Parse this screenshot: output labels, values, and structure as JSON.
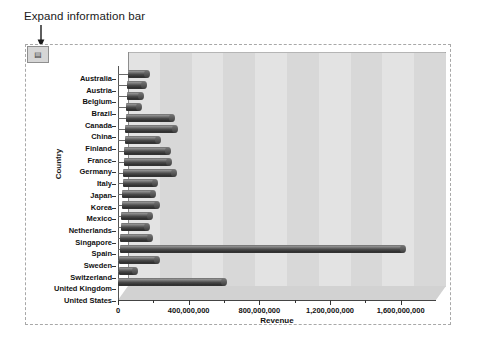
{
  "annotation": {
    "text": "Expand information bar",
    "arrow_icon": "down-arrow-icon"
  },
  "toolbar": {
    "expand_button_label": "▤",
    "expand_button_name": "expand-information-bar-button"
  },
  "chart_data": {
    "type": "bar",
    "orientation": "horizontal",
    "title": "",
    "xlabel": "Revenue",
    "ylabel": "Country",
    "xlim": [
      0,
      1800000000
    ],
    "grid": true,
    "legend": null,
    "xticks": [
      0,
      400000000,
      800000000,
      1200000000,
      1600000000
    ],
    "xticklabels": [
      "0",
      "400,000,000",
      "800,000,000",
      "1,200,000,000",
      "1,600,000,000"
    ],
    "categories": [
      "Australia",
      "Austria",
      "Belgium",
      "Brazil",
      "Canada",
      "China",
      "Finland",
      "France",
      "Germany",
      "Italy",
      "Japan",
      "Korea",
      "Mexico",
      "Netherlands",
      "Singapore",
      "Spain",
      "Sweden",
      "Switzerland",
      "United Kingdom",
      "United States"
    ],
    "values": [
      110000000,
      95000000,
      80000000,
      70000000,
      260000000,
      280000000,
      190000000,
      250000000,
      255000000,
      290000000,
      180000000,
      175000000,
      200000000,
      165000000,
      150000000,
      170000000,
      1605000000,
      215000000,
      95000000,
      600000000
    ],
    "series_name": "Revenue",
    "bar_color": "#3c3c3c",
    "plot_background": "#e3e3e3",
    "band_color": "#d8d8d8"
  }
}
